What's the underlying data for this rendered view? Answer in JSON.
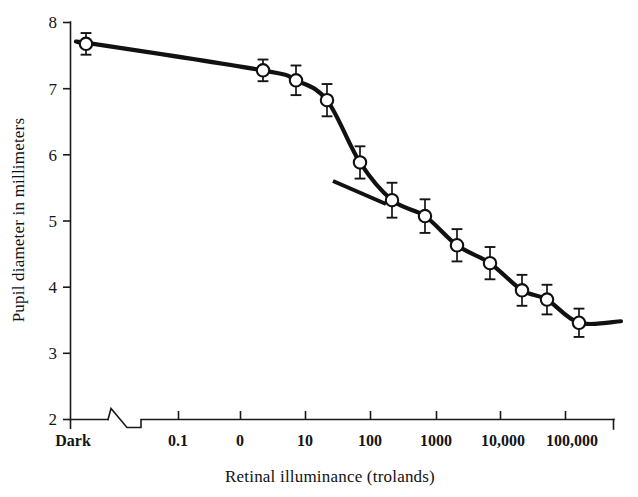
{
  "chart_data": {
    "type": "line",
    "title": "",
    "subtitle": "",
    "xlabel": "Retinal illuminance (trolands)",
    "ylabel": "Pupil diameter in millimeters",
    "grid": false,
    "legend": "none",
    "annotations": [
      "tangent line drawn through curve at steepest slope near 100 trolands"
    ],
    "x_axis": {
      "scale": "log",
      "break_after_first_tick": true,
      "tick_labels": [
        "Dark",
        "0.1",
        "0",
        "10",
        "100",
        "1000",
        "10,000",
        "100,000"
      ],
      "tick_positions_px": [
        70,
        178,
        240,
        305,
        370,
        436,
        500,
        565
      ]
    },
    "y_axis": {
      "scale": "linear",
      "ylim": [
        2,
        8
      ],
      "tick_labels": [
        "2",
        "3",
        "4",
        "5",
        "6",
        "7",
        "8"
      ],
      "tick_values": [
        2,
        3,
        4,
        5,
        6,
        7,
        8
      ]
    },
    "series": [
      {
        "name": "Pupil diameter",
        "marker": "open-circle",
        "points": [
          {
            "x_label": "Dark",
            "x_px": 86,
            "y": 7.67,
            "err": 0.07
          },
          {
            "x_label": "2",
            "x_px": 263,
            "y": 7.27,
            "err": 0.07
          },
          {
            "x_label": "6",
            "x_px": 296,
            "y": 7.12,
            "err": 0.13
          },
          {
            "x_label": "25",
            "x_px": 327,
            "y": 6.82,
            "err": 0.15
          },
          {
            "x_label": "70",
            "x_px": 360,
            "y": 5.88,
            "err": 0.15
          },
          {
            "x_label": "200",
            "x_px": 392,
            "y": 5.31,
            "err": 0.17
          },
          {
            "x_label": "600",
            "x_px": 425,
            "y": 5.07,
            "err": 0.16
          },
          {
            "x_label": "2000",
            "x_px": 457,
            "y": 4.63,
            "err": 0.15
          },
          {
            "x_label": "6000",
            "x_px": 490,
            "y": 4.36,
            "err": 0.15
          },
          {
            "x_label": "20,000",
            "x_px": 522,
            "y": 3.95,
            "err": 0.14
          },
          {
            "x_label": "60,000",
            "x_px": 547,
            "y": 3.81,
            "err": 0.13
          },
          {
            "x_label": "200,000",
            "x_px": 579,
            "y": 3.46,
            "err": 0.12
          }
        ]
      }
    ]
  },
  "labels": {
    "y_axis_title": "Pupil diameter in millimeters",
    "x_axis_title": "Retinal illuminance (trolands)",
    "y_ticks": {
      "t8": "8",
      "t7": "7",
      "t6": "6",
      "t5": "5",
      "t4": "4",
      "t3": "3",
      "t2": "2"
    },
    "x_ticks": {
      "dark": "Dark",
      "p1": "0.1",
      "zero": "0",
      "ten": "10",
      "hundred": "100",
      "thousand": "1000",
      "tenk": "10,000",
      "hundredk": "100,000"
    }
  },
  "colors": {
    "ink": "#111111",
    "background": "#ffffff",
    "marker_fill": "#ffffff"
  }
}
